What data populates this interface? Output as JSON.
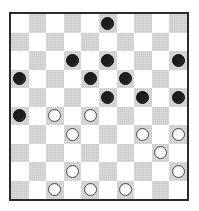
{
  "board": {
    "title": "International Draughts Position",
    "type": "checkers-board",
    "rows": 10,
    "cols": 10,
    "light_square_color": "#ffffff",
    "dark_square_color": "#c9c9c9",
    "frame_color": "#2b2b2b",
    "black_piece_color": "#1d1d1d",
    "white_piece_color": "#fdfdfd",
    "white_piece_outline_color": "#4a4a4a",
    "top_left_square": "light",
    "black_piece_count": 11,
    "white_piece_count": 11,
    "pieces": [
      {
        "row": 1,
        "col": 6,
        "color": "black"
      },
      {
        "row": 3,
        "col": 4,
        "color": "black"
      },
      {
        "row": 3,
        "col": 6,
        "color": "black"
      },
      {
        "row": 3,
        "col": 10,
        "color": "black"
      },
      {
        "row": 4,
        "col": 1,
        "color": "black"
      },
      {
        "row": 4,
        "col": 5,
        "color": "black"
      },
      {
        "row": 4,
        "col": 7,
        "color": "black"
      },
      {
        "row": 5,
        "col": 6,
        "color": "black"
      },
      {
        "row": 5,
        "col": 8,
        "color": "black"
      },
      {
        "row": 5,
        "col": 10,
        "color": "black"
      },
      {
        "row": 6,
        "col": 1,
        "color": "black"
      },
      {
        "row": 6,
        "col": 3,
        "color": "white"
      },
      {
        "row": 6,
        "col": 5,
        "color": "white"
      },
      {
        "row": 7,
        "col": 4,
        "color": "white"
      },
      {
        "row": 7,
        "col": 8,
        "color": "white"
      },
      {
        "row": 7,
        "col": 10,
        "color": "white"
      },
      {
        "row": 8,
        "col": 9,
        "color": "white"
      },
      {
        "row": 9,
        "col": 4,
        "color": "white"
      },
      {
        "row": 9,
        "col": 10,
        "color": "white"
      },
      {
        "row": 10,
        "col": 3,
        "color": "white"
      },
      {
        "row": 10,
        "col": 5,
        "color": "white"
      },
      {
        "row": 10,
        "col": 7,
        "color": "white"
      }
    ]
  }
}
